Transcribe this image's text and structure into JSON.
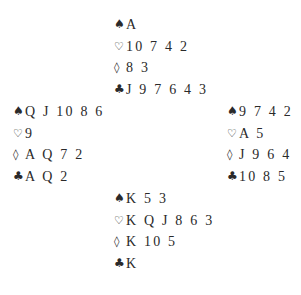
{
  "diagram": {
    "type": "bridge-deal",
    "suit_symbols": {
      "spades": "♠",
      "hearts": "♡",
      "diamonds": "◊",
      "clubs": "♣"
    },
    "hands": {
      "north": {
        "spades": "A",
        "hearts": "10 7 4 2",
        "diamonds": "8 3",
        "clubs": "J 9 7 6 4 3"
      },
      "west": {
        "spades": "Q J 10 8 6",
        "hearts": "9",
        "diamonds": "A Q 7 2",
        "clubs": "A Q 2"
      },
      "east": {
        "spades": "9 7 4 2",
        "hearts": "A 5",
        "diamonds": "J 9 6 4",
        "clubs": "10 8 5"
      },
      "south": {
        "spades": "K 5 3",
        "hearts": "K Q J 8 6 3",
        "diamonds": "K 10 5",
        "clubs": "K"
      }
    }
  }
}
